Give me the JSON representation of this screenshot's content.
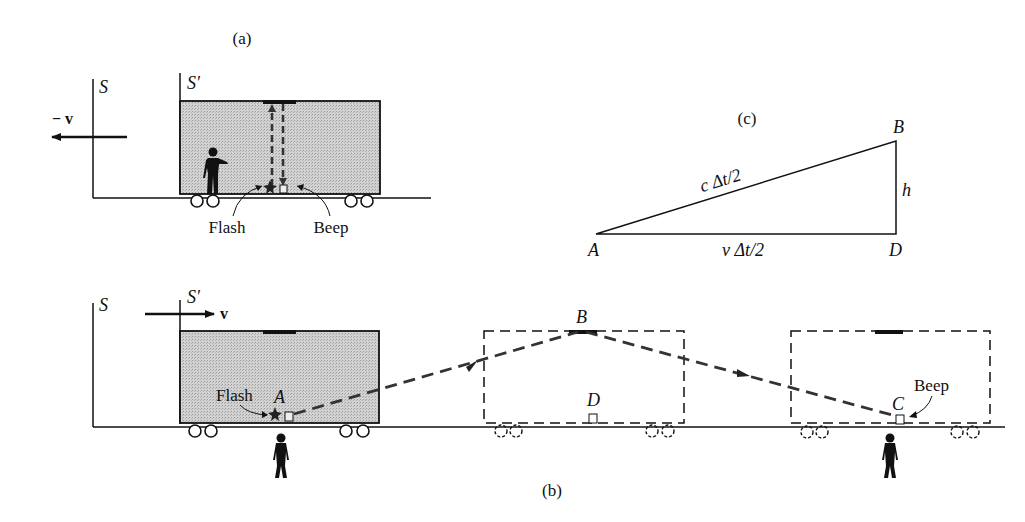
{
  "panels": {
    "a": {
      "caption": "(a)",
      "frame_S": "S",
      "frame_S_prime": "S′",
      "velocity_label": "− v",
      "flash_label": "Flash",
      "beep_label": "Beep"
    },
    "b": {
      "caption": "(b)",
      "frame_S": "S",
      "frame_S_prime": "S′",
      "velocity_label": "v",
      "flash_label": "Flash",
      "beep_label": "Beep",
      "point_A": "A",
      "point_B": "B",
      "point_C": "C",
      "point_D": "D"
    },
    "c": {
      "caption": "(c)",
      "vertex_A": "A",
      "vertex_B": "B",
      "vertex_D": "D",
      "hypotenuse_label": "c Δt/2",
      "base_label": "v Δt/2",
      "height_label": "h"
    }
  },
  "colors": {
    "ink": "#111111",
    "car_fill": "#c8c8c8",
    "background": "#ffffff"
  }
}
